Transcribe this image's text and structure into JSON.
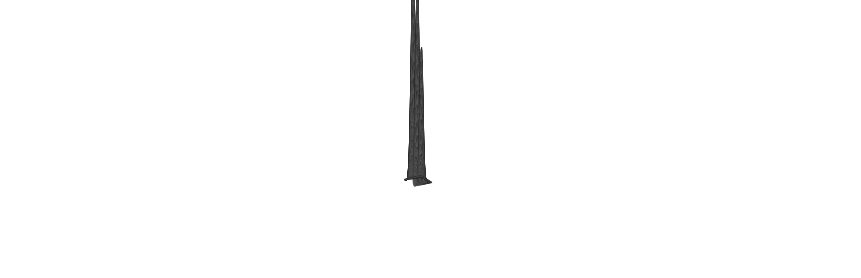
{
  "figure": {
    "name": "gaussian-peaks-wireframe-surface",
    "kind": "3d-wireframe-mesh-surface",
    "width": 861,
    "height": 278,
    "background_color": "#ffffff",
    "line_color": "#2a2a2a",
    "title": "",
    "subtitle": "",
    "axis_visible": false,
    "axis_labels_visible": false,
    "tick_labels_visible": false,
    "legend_visible": false
  },
  "chart_data": {
    "type": "surface",
    "title": "",
    "xlabel": "",
    "ylabel": "",
    "zlabel": "",
    "grid": true,
    "legend_position": "none",
    "xlim": [
      -3.0,
      3.0
    ],
    "ylim": [
      -3.0,
      3.0
    ],
    "zlim": [
      0.0,
      1.0
    ],
    "mesh_nx": 46,
    "mesh_ny": 46,
    "surface_style": "wireframe-hidden-line-removed",
    "peaks": [
      {
        "label": "peak-1",
        "order": 1,
        "center_x": -1.75,
        "center_y": 0.15,
        "amplitude": 1.0,
        "sigma_x": 0.52,
        "sigma_y": 0.72,
        "apex_pixel_x": 356,
        "apex_pixel_y": 10,
        "relative_height_pct": 100
      },
      {
        "label": "peak-2",
        "order": 2,
        "center_x": -0.22,
        "center_y": 0.05,
        "amplitude": 0.93,
        "sigma_x": 0.42,
        "sigma_y": 0.64,
        "apex_pixel_x": 437,
        "apex_pixel_y": 17,
        "relative_height_pct": 93
      },
      {
        "label": "peak-3",
        "order": 3,
        "center_x": 1.22,
        "center_y": -0.05,
        "amplitude": 0.62,
        "sigma_x": 0.38,
        "sigma_y": 0.58,
        "apex_pixel_x": 585,
        "apex_pixel_y": 98,
        "relative_height_pct": 62
      },
      {
        "label": "ridge-shoulder",
        "order": 4,
        "center_x": -2.25,
        "center_y": 1.35,
        "amplitude": 0.17,
        "sigma_x": 0.62,
        "sigma_y": 0.45,
        "apex_pixel_x": 205,
        "apex_pixel_y": 128,
        "relative_height_pct": 17
      }
    ],
    "base_plane": {
      "value": 0.0,
      "corner_left_pixel": [
        50,
        213
      ],
      "corner_back_pixel": [
        300,
        120
      ],
      "corner_right_pixel": [
        812,
        147
      ],
      "corner_front_pixel": [
        560,
        252
      ]
    },
    "projection": {
      "type": "oblique-parallel",
      "azimuth_deg": -37.5,
      "elevation_deg": 22.0,
      "x_axis_screen_vector": [
        2.92,
        -0.62
      ],
      "y_axis_screen_vector": [
        1.78,
        1.12
      ],
      "z_axis_screen_pixels_per_unit": 215.0,
      "origin_pixel": [
        418,
        181
      ]
    }
  }
}
